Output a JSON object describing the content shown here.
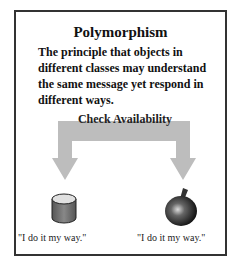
{
  "title": "Polymorphism",
  "description": "The principle that objects in different classes may understand the same message yet respond in different ways.",
  "message": "Check Availability",
  "objects": [
    {
      "icon": "cylinder-icon",
      "response": "\"I do it my way.\""
    },
    {
      "icon": "apple-icon",
      "response": "\"I do it my way.\""
    }
  ],
  "colors": {
    "arrow": "#bdbdbd",
    "border": "#333333"
  }
}
